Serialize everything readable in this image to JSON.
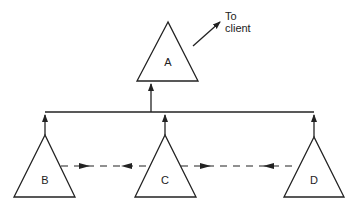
{
  "diagram": {
    "nodes": [
      {
        "id": "A",
        "label": "A"
      },
      {
        "id": "B",
        "label": "B"
      },
      {
        "id": "C",
        "label": "C"
      },
      {
        "id": "D",
        "label": "D"
      }
    ],
    "annotation": {
      "line1": "To",
      "line2": "client"
    },
    "colors": {
      "stroke": "#222222",
      "background": "#ffffff"
    }
  }
}
